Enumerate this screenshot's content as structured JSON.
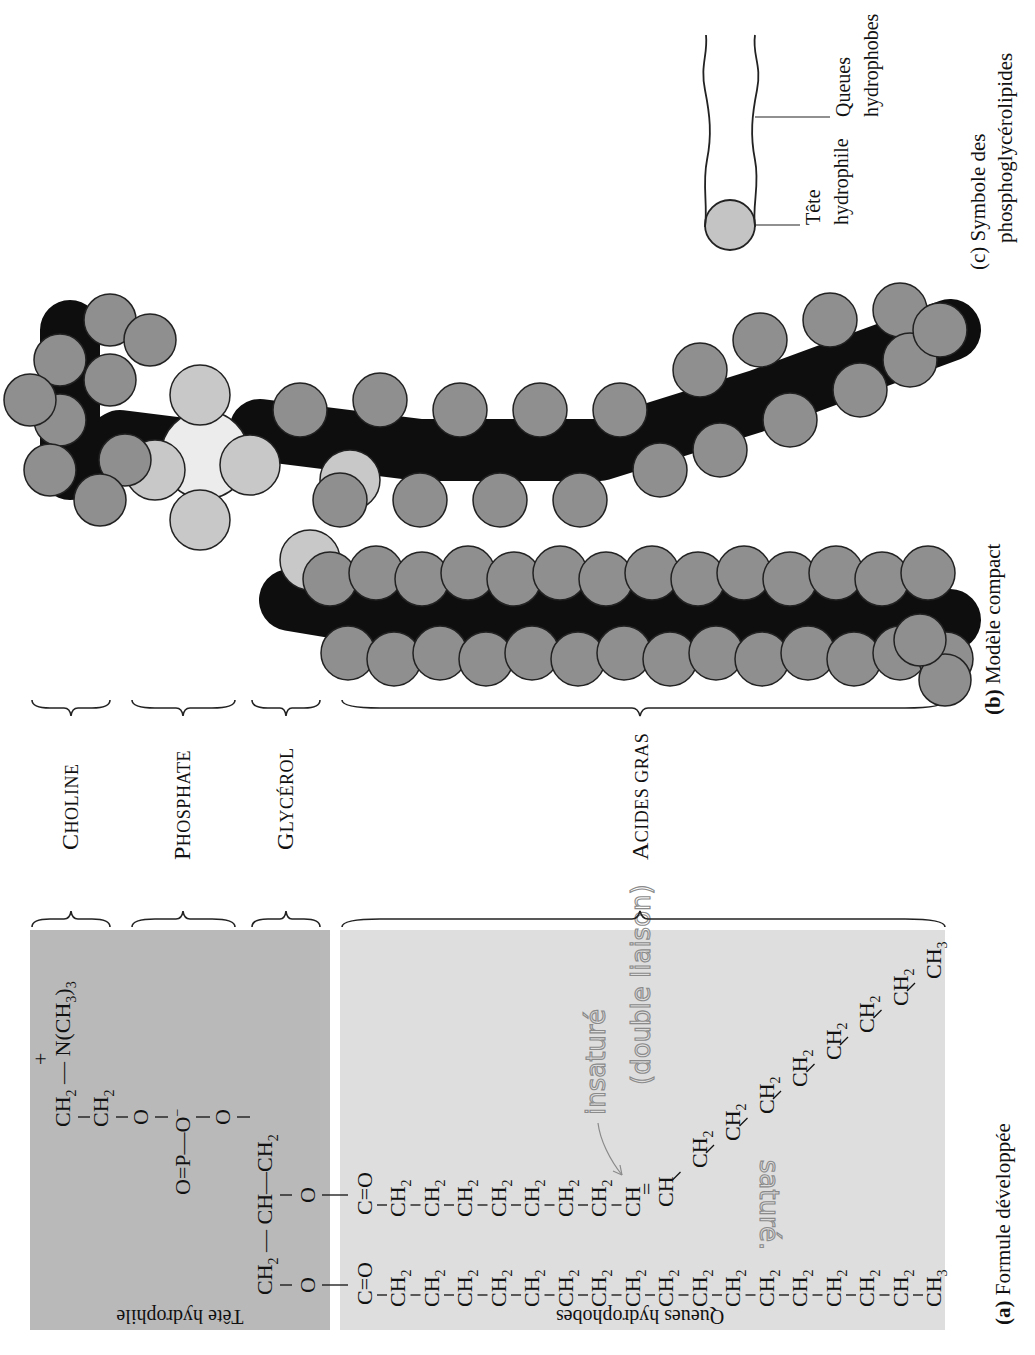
{
  "figure": {
    "panel_a": {
      "caption_letter": "(a)",
      "caption_text": "Formule développée",
      "head_panel_label": "Tête hydrophile",
      "tail_panel_label": "Queues hydrophobes",
      "head_color": "#b9b9b9",
      "tail_color": "#dedede",
      "choline_formula": {
        "row1": [
          "CH2",
          "—",
          "N(CH3)3",
          "+"
        ],
        "row2": [
          "CH2"
        ]
      },
      "phosphate_formula": [
        "O",
        "=",
        "P",
        "—",
        "O⁻"
      ],
      "glycerol_formula": [
        "CH2",
        "—",
        "CH",
        "—",
        "CH2"
      ],
      "chain_saturated": {
        "start": "C=O",
        "units": [
          "CH2",
          "CH2",
          "CH2",
          "CH2",
          "CH2",
          "CH2",
          "CH2",
          "CH2",
          "CH2",
          "CH2",
          "CH2",
          "CH2",
          "CH2",
          "CH2",
          "CH2",
          "CH2"
        ],
        "end": "CH3"
      },
      "chain_unsaturated": {
        "start": "C=O",
        "units_before_double": [
          "CH2",
          "CH2",
          "CH2",
          "CH2",
          "CH2",
          "CH2",
          "CH2"
        ],
        "double_bond": [
          "CH",
          "=",
          "CH"
        ],
        "units_after_double": [
          "CH2",
          "CH2",
          "CH2",
          "CH2",
          "CH2",
          "CH2",
          "CH2"
        ],
        "end": "CH3"
      },
      "handwritten_notes": {
        "unsaturated": "insaturé",
        "double_bond": "(double liaison)",
        "saturated": "saturé."
      }
    },
    "brackets": [
      {
        "label_initial": "C",
        "label_rest": "HOLINE"
      },
      {
        "label_initial": "P",
        "label_rest": "HOSPHATE"
      },
      {
        "label_initial": "G",
        "label_rest": "LYCÉROL"
      },
      {
        "label_initial": "A",
        "label_rest": "CIDES GRAS"
      }
    ],
    "panel_b": {
      "caption_letter": "(b)",
      "caption_text": "Modèle compact",
      "atom_colors": {
        "hydrogen": "#8f8f8f",
        "oxygen_phosphate": "#c8c8c8",
        "carbon": "#0e0e0e",
        "phosphorus": "#ececec"
      }
    },
    "panel_c": {
      "caption_letter": "(c)",
      "caption_line1": "Symbole des",
      "caption_line2": "phosphoglycérolipides",
      "head_label_line1": "Tête",
      "head_label_line2": "hydrophile",
      "tail_label_line1": "Queues",
      "tail_label_line2": "hydrophobes",
      "head_color": "#c4c4c4"
    }
  }
}
